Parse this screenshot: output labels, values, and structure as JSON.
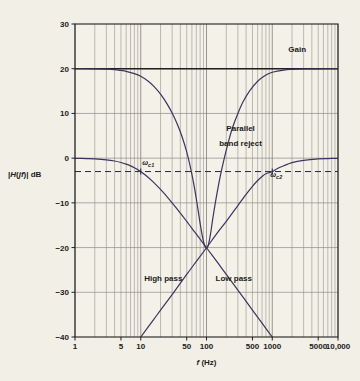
{
  "chart_data": {
    "type": "line",
    "title": "",
    "xlabel": "f (Hz)",
    "ylabel": "|H(jf)| dB",
    "xscale": "log",
    "xlim": [
      1,
      10000
    ],
    "ylim": [
      -40,
      30
    ],
    "grid": true,
    "legend_position": "inline-annotations",
    "xticks": [
      {
        "value": 1,
        "label": "1"
      },
      {
        "value": 5,
        "label": "5"
      },
      {
        "value": 10,
        "label": "10"
      },
      {
        "value": 50,
        "label": "50"
      },
      {
        "value": 100,
        "label": "100"
      },
      {
        "value": 500,
        "label": "500"
      },
      {
        "value": 1000,
        "label": "1000"
      },
      {
        "value": 5000,
        "label": "5000"
      },
      {
        "value": 10000,
        "label": "10,000"
      }
    ],
    "yticks": [
      {
        "value": 30,
        "label": "30"
      },
      {
        "value": 20,
        "label": "20"
      },
      {
        "value": 10,
        "label": "10"
      },
      {
        "value": 0,
        "label": "0"
      },
      {
        "value": -10,
        "label": "−10"
      },
      {
        "value": -20,
        "label": "−20"
      },
      {
        "value": -30,
        "label": "−30"
      },
      {
        "value": -40,
        "label": "−40"
      }
    ],
    "reference_lines": [
      {
        "name": "minus-3db-dashed",
        "axis": "y",
        "value": -3,
        "style": "dashed"
      }
    ],
    "series": [
      {
        "name": "Gain",
        "label": "Gain",
        "style": "solid",
        "color": "#231f20",
        "width": 1.6,
        "description": "Flat 20 dB gain line across full band",
        "points": [
          [
            1,
            20
          ],
          [
            10000,
            20
          ]
        ]
      },
      {
        "name": "Low pass",
        "label": "Low pass",
        "style": "solid",
        "color": "#3a3560",
        "width": 1.2,
        "description": "First-order low-pass: 0 dB passband, -3 dB at 10 Hz, -20 dB/decade rolloff through (100, -20)",
        "points": [
          [
            1,
            -0.04
          ],
          [
            1.5,
            -0.1
          ],
          [
            2,
            -0.17
          ],
          [
            3,
            -0.37
          ],
          [
            4,
            -0.64
          ],
          [
            5,
            -0.97
          ],
          [
            6,
            -1.34
          ],
          [
            7,
            -1.73
          ],
          [
            8,
            -2.15
          ],
          [
            9,
            -2.57
          ],
          [
            10,
            -3.01
          ],
          [
            12,
            -3.88
          ],
          [
            15,
            -5.15
          ],
          [
            20,
            -7.0
          ],
          [
            25,
            -8.6
          ],
          [
            30,
            -10.0
          ],
          [
            40,
            -12.3
          ],
          [
            50,
            -14.15
          ],
          [
            60,
            -15.7
          ],
          [
            80,
            -18.1
          ],
          [
            100,
            -20.04
          ],
          [
            150,
            -23.5
          ],
          [
            200,
            -26.0
          ],
          [
            300,
            -29.5
          ],
          [
            500,
            -33.98
          ],
          [
            700,
            -36.9
          ],
          [
            1000,
            -40.0
          ]
        ]
      },
      {
        "name": "High pass",
        "label": "High pass",
        "style": "solid",
        "color": "#3a3560",
        "width": 1.2,
        "description": "First-order high-pass: +20 dB/decade rise through (100, -20), -3 dB at 1000 Hz, 0 dB passband above",
        "points": [
          [
            10,
            -40.0
          ],
          [
            15,
            -36.5
          ],
          [
            20,
            -34.0
          ],
          [
            30,
            -30.5
          ],
          [
            50,
            -26.0
          ],
          [
            70,
            -23.1
          ],
          [
            100,
            -20.04
          ],
          [
            150,
            -16.5
          ],
          [
            200,
            -14.15
          ],
          [
            300,
            -10.6
          ],
          [
            400,
            -8.1
          ],
          [
            500,
            -6.3
          ],
          [
            600,
            -5.0
          ],
          [
            700,
            -4.1
          ],
          [
            800,
            -3.5
          ],
          [
            1000,
            -3.01
          ],
          [
            1200,
            -2.3
          ],
          [
            1500,
            -1.7
          ],
          [
            2000,
            -1.0
          ],
          [
            3000,
            -0.5
          ],
          [
            5000,
            -0.17
          ],
          [
            7000,
            -0.09
          ],
          [
            10000,
            -0.04
          ]
        ]
      },
      {
        "name": "Parallel band reject",
        "label": "Parallel band reject",
        "style": "solid",
        "color": "#3a3560",
        "width": 1.2,
        "description": "Band-reject (notch) response: 20 dB plateau at both extremes with deep notch to -20 dB at 100 Hz",
        "points": [
          [
            1,
            20.0
          ],
          [
            2,
            19.97
          ],
          [
            3,
            19.9
          ],
          [
            4,
            19.8
          ],
          [
            5,
            19.6
          ],
          [
            6,
            19.4
          ],
          [
            8,
            18.9
          ],
          [
            10,
            18.3
          ],
          [
            13,
            17.2
          ],
          [
            16,
            16.0
          ],
          [
            20,
            14.3
          ],
          [
            25,
            12.2
          ],
          [
            30,
            10.1
          ],
          [
            36,
            7.6
          ],
          [
            42,
            5.0
          ],
          [
            50,
            1.4
          ],
          [
            58,
            -2.6
          ],
          [
            65,
            -6.3
          ],
          [
            72,
            -10.2
          ],
          [
            80,
            -14.6
          ],
          [
            88,
            -18.0
          ],
          [
            95,
            -19.8
          ],
          [
            100,
            -20.1
          ],
          [
            106,
            -19.6
          ],
          [
            115,
            -17.0
          ],
          [
            125,
            -13.4
          ],
          [
            140,
            -9.0
          ],
          [
            160,
            -4.4
          ],
          [
            185,
            -0.2
          ],
          [
            215,
            3.6
          ],
          [
            250,
            6.9
          ],
          [
            300,
            10.0
          ],
          [
            360,
            12.6
          ],
          [
            450,
            15.0
          ],
          [
            600,
            17.2
          ],
          [
            800,
            18.6
          ],
          [
            1000,
            19.2
          ],
          [
            1500,
            19.7
          ],
          [
            2000,
            19.85
          ],
          [
            3000,
            19.94
          ],
          [
            5000,
            19.98
          ],
          [
            10000,
            20.0
          ]
        ]
      }
    ],
    "annotations": [
      {
        "name": "gain-label",
        "text": "Gain",
        "x": 2400,
        "y": 23.8
      },
      {
        "name": "parallel-band-reject-label-line1",
        "text": "Parallel",
        "x": 330,
        "y": 6.0
      },
      {
        "name": "parallel-band-reject-label-line2",
        "text": "band reject",
        "x": 330,
        "y": 2.8
      },
      {
        "name": "high-pass-label",
        "text": "High pass",
        "x": 22,
        "y": -27.4
      },
      {
        "name": "low-pass-label",
        "text": "Low pass",
        "x": 260,
        "y": -27.4
      },
      {
        "name": "wc1-label",
        "text": "ω",
        "sub": "c1",
        "x": 13,
        "y": -1.6
      },
      {
        "name": "wc2-label",
        "text": "ω",
        "sub": "c2",
        "x": 1150,
        "y": -4.2
      }
    ]
  },
  "colors": {
    "background": "#f2efe6",
    "plot_background": "#f4f1e8",
    "axis": "#231f20",
    "gridline": "#8c8a85",
    "gain_curve": "#231f20",
    "filter_curve": "#3a3560",
    "text": "#1b1b1b"
  }
}
